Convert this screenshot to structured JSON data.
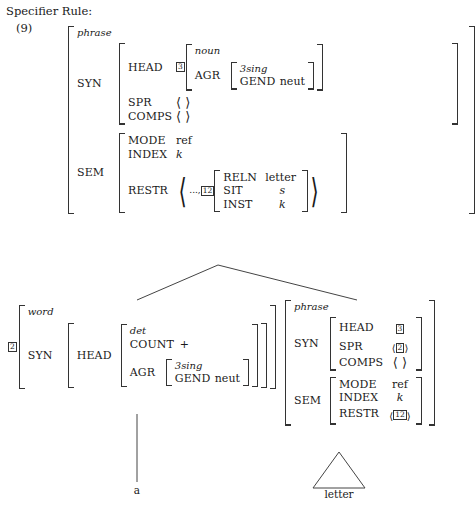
{
  "header": {
    "caption": "Specifier Rule:",
    "example_number": "(9)"
  },
  "tags": {
    "three": "3",
    "two": "2",
    "twelve": "12"
  },
  "angle": {
    "open": "⟨",
    "close": "⟩",
    "empty": "⟨ ⟩",
    "ellipsis": "...,"
  },
  "mother": {
    "type": "phrase",
    "syn": {
      "label": "SYN",
      "head": {
        "attr": "HEAD",
        "tag": "3",
        "value": {
          "type": "noun",
          "agr": {
            "attr": "AGR",
            "type": "3sing",
            "gend_attr": "GEND",
            "gend_value": "neut"
          }
        }
      },
      "spr": {
        "attr": "SPR",
        "value": "⟨ ⟩"
      },
      "comps": {
        "attr": "COMPS",
        "value": "⟨ ⟩"
      }
    },
    "sem": {
      "label": "SEM",
      "mode": {
        "attr": "MODE",
        "value": "ref"
      },
      "index": {
        "attr": "INDEX",
        "value": "k"
      },
      "restr": {
        "attr": "RESTR",
        "prefix": "...,",
        "tag": "12",
        "pred": {
          "reln_attr": "RELN",
          "reln_value": "letter",
          "sit_attr": "SIT",
          "sit_value": "s",
          "inst_attr": "INST",
          "inst_value": "k"
        }
      }
    }
  },
  "specifier_daughter": {
    "tag": "2",
    "type": "word",
    "syn": {
      "label": "SYN",
      "head": {
        "attr": "HEAD",
        "type": "det",
        "count_attr": "COUNT",
        "count_value": "+",
        "agr": {
          "attr": "AGR",
          "type": "3sing",
          "gend_attr": "GEND",
          "gend_value": "neut"
        }
      }
    },
    "terminal": "a"
  },
  "head_daughter": {
    "type": "phrase",
    "syn": {
      "label": "SYN",
      "head": {
        "attr": "HEAD",
        "tag": "3"
      },
      "spr": {
        "attr": "SPR",
        "value_open": "⟨",
        "tag": "2",
        "value_close": "⟩"
      },
      "comps": {
        "attr": "COMPS",
        "value": "⟨ ⟩"
      }
    },
    "sem": {
      "label": "SEM",
      "mode": {
        "attr": "MODE",
        "value": "ref"
      },
      "index": {
        "attr": "INDEX",
        "value": "k"
      },
      "restr": {
        "attr": "RESTR",
        "value_open": "⟨",
        "tag": "12",
        "value_close": "⟩"
      }
    },
    "terminal": "letter"
  }
}
